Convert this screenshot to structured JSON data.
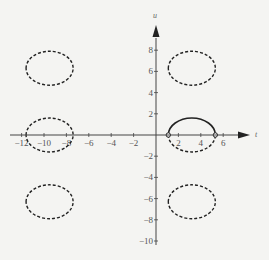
{
  "chart_data": {
    "type": "line",
    "title": "",
    "xlabel": "t",
    "ylabel": "u",
    "xlim": [
      -13,
      9
    ],
    "ylim": [
      -11,
      10
    ],
    "x_ticks": [
      -12,
      -10,
      -8,
      -6,
      -4,
      -2,
      2,
      4,
      6
    ],
    "y_ticks": [
      -10,
      -8,
      -6,
      -4,
      -2,
      2,
      4,
      6,
      8
    ],
    "x_tick_labels": [
      "−12",
      "−10",
      "−8",
      "−6",
      "−4",
      "−2",
      "2",
      "4",
      "6"
    ],
    "y_tick_labels": [
      "−10",
      "−8",
      "−6",
      "−4",
      "−2",
      "2",
      "4",
      "6",
      "8"
    ],
    "grid": false,
    "legend": null,
    "series": [
      {
        "name": "solid upper arc",
        "style": "solid",
        "shape": "upper half-ellipse",
        "center": [
          3.2,
          0
        ],
        "rx": 2.1,
        "ry": 1.6,
        "endpoints": [
          [
            1.1,
            0
          ],
          [
            5.3,
            0
          ]
        ]
      },
      {
        "name": "dashed lower arc",
        "style": "dashed",
        "shape": "lower half-ellipse",
        "center": [
          3.2,
          0
        ],
        "rx": 2.1,
        "ry": 1.6
      },
      {
        "name": "dashed closed curve left-center",
        "style": "dashed",
        "shape": "ellipse",
        "center": [
          -9.5,
          0
        ],
        "rx": 2.1,
        "ry": 1.6
      },
      {
        "name": "dashed closed curve upper-left",
        "style": "dashed",
        "shape": "ellipse",
        "center": [
          -9.5,
          6.3
        ],
        "rx": 2.1,
        "ry": 1.6
      },
      {
        "name": "dashed closed curve upper-right",
        "style": "dashed",
        "shape": "ellipse",
        "center": [
          3.2,
          6.3
        ],
        "rx": 2.1,
        "ry": 1.6
      },
      {
        "name": "dashed closed curve lower-left",
        "style": "dashed",
        "shape": "ellipse",
        "center": [
          -9.5,
          -6.3
        ],
        "rx": 2.1,
        "ry": 1.6
      },
      {
        "name": "dashed closed curve lower-right",
        "style": "dashed",
        "shape": "ellipse",
        "center": [
          3.2,
          -6.3
        ],
        "rx": 2.1,
        "ry": 1.6
      }
    ],
    "annotations": [
      {
        "type": "open-circle",
        "x": 1.1,
        "y": 0
      },
      {
        "type": "open-circle",
        "x": 5.3,
        "y": 0
      }
    ]
  },
  "axes": {
    "x_label": "t",
    "y_label": "u"
  }
}
